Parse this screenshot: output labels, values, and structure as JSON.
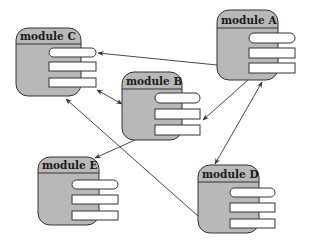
{
  "diagram": {
    "type": "module-dependency",
    "colors": {
      "module_fill": "#b8b8b8",
      "module_stroke": "#333333",
      "slot_fill": "#ffffff",
      "edge": "#333333",
      "background": "#ffffff"
    },
    "modules": [
      {
        "id": "C",
        "label": "module C",
        "x": 16,
        "y": 28,
        "w": 65,
        "h": 68,
        "header_h": 16,
        "slots": [
          {
            "x": 49,
            "y": 48,
            "w": 47,
            "h": 9,
            "rounded": true
          },
          {
            "x": 49,
            "y": 62,
            "w": 47,
            "h": 9,
            "rounded": false
          },
          {
            "x": 49,
            "y": 78,
            "w": 47,
            "h": 9,
            "rounded": false
          }
        ]
      },
      {
        "id": "A",
        "label": "module A",
        "x": 217,
        "y": 10,
        "w": 61,
        "h": 70,
        "header_h": 18,
        "slots": [
          {
            "x": 249,
            "y": 33,
            "w": 46,
            "h": 10,
            "rounded": true
          },
          {
            "x": 249,
            "y": 48,
            "w": 46,
            "h": 10,
            "rounded": false
          },
          {
            "x": 249,
            "y": 63,
            "w": 46,
            "h": 10,
            "rounded": false
          }
        ]
      },
      {
        "id": "B",
        "label": "module B",
        "x": 122,
        "y": 72,
        "w": 60,
        "h": 68,
        "header_h": 17,
        "slots": [
          {
            "x": 155,
            "y": 93,
            "w": 45,
            "h": 10,
            "rounded": true
          },
          {
            "x": 155,
            "y": 109,
            "w": 45,
            "h": 10,
            "rounded": false
          },
          {
            "x": 155,
            "y": 125,
            "w": 45,
            "h": 10,
            "rounded": false
          }
        ]
      },
      {
        "id": "E",
        "label": "module E",
        "x": 38,
        "y": 157,
        "w": 61,
        "h": 68,
        "header_h": 16,
        "slots": [
          {
            "x": 72,
            "y": 180,
            "w": 46,
            "h": 9,
            "rounded": true
          },
          {
            "x": 72,
            "y": 195,
            "w": 46,
            "h": 9,
            "rounded": false
          },
          {
            "x": 72,
            "y": 211,
            "w": 46,
            "h": 9,
            "rounded": false
          }
        ]
      },
      {
        "id": "D",
        "label": "module D",
        "x": 198,
        "y": 165,
        "w": 61,
        "h": 68,
        "header_h": 17,
        "slots": [
          {
            "x": 230,
            "y": 188,
            "w": 45,
            "h": 9,
            "rounded": true
          },
          {
            "x": 230,
            "y": 203,
            "w": 45,
            "h": 9,
            "rounded": false
          },
          {
            "x": 230,
            "y": 219,
            "w": 45,
            "h": 9,
            "rounded": false
          }
        ]
      }
    ],
    "edges": [
      {
        "from": "A",
        "to": "C",
        "x1": 217,
        "y1": 65,
        "x2": 98,
        "y2": 53,
        "arrow_start": false,
        "arrow_end": true
      },
      {
        "from": "C",
        "to": "B",
        "x1": 97,
        "y1": 90,
        "x2": 122,
        "y2": 104,
        "arrow_start": true,
        "arrow_end": true
      },
      {
        "from": "A",
        "to": "B",
        "x1": 248,
        "y1": 80,
        "x2": 203,
        "y2": 120,
        "arrow_start": false,
        "arrow_end": true
      },
      {
        "from": "D",
        "to": "A",
        "x1": 215,
        "y1": 164,
        "x2": 262,
        "y2": 82,
        "arrow_start": true,
        "arrow_end": true
      },
      {
        "from": "B",
        "to": "E",
        "x1": 135,
        "y1": 140,
        "x2": 95,
        "y2": 158,
        "arrow_start": false,
        "arrow_end": true
      },
      {
        "from": "D",
        "to": "C",
        "x1": 198,
        "y1": 216,
        "x2": 66,
        "y2": 99,
        "arrow_start": false,
        "arrow_end": true
      }
    ]
  }
}
